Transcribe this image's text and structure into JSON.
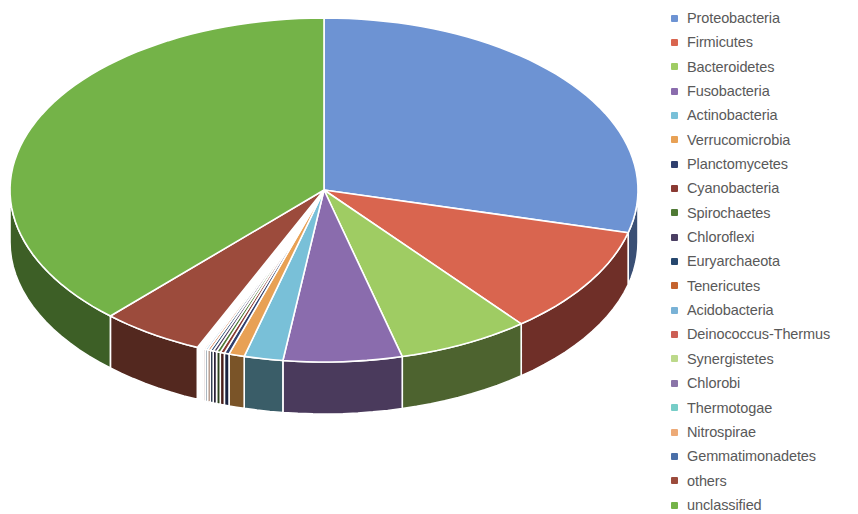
{
  "chart_data": {
    "type": "pie",
    "title": "",
    "subtitle": "",
    "xlabel": "",
    "ylabel": "",
    "legend_position": "right",
    "grid": false,
    "three_d": true,
    "start_angle_deg": 0,
    "direction": "clockwise",
    "labels": [
      "Proteobacteria",
      "Firmicutes",
      "Bacteroidetes",
      "Fusobacteria",
      "Actinobacteria",
      "Verrucomicrobia",
      "Planctomycetes",
      "Cyanobacteria",
      "Spirochaetes",
      "Chloroflexi",
      "Euryarchaeota",
      "Tenericutes",
      "Acidobacteria",
      "Deinococcus-Thermus",
      "Synergistetes",
      "Chlorobi",
      "Thermotogae",
      "Nitrospirae",
      "Gemmatimonadetes",
      "others",
      "unclassified"
    ],
    "values": [
      29.0,
      10.2,
      6.8,
      6.1,
      2.0,
      0.8,
      0.25,
      0.22,
      0.2,
      0.18,
      0.16,
      0.14,
      0.12,
      0.1,
      0.09,
      0.08,
      0.07,
      0.06,
      0.05,
      5.3,
      38.1
    ],
    "colors": [
      "#6d93d3",
      "#d9654f",
      "#9fcc63",
      "#8a6cad",
      "#79c0d8",
      "#e8a155",
      "#2f3f6e",
      "#8a3a33",
      "#4f7a35",
      "#4b3f63",
      "#26476e",
      "#c5632e",
      "#79b2d6",
      "#cc5f55",
      "#bcd98a",
      "#8a74a8",
      "#76cdc7",
      "#edaa77",
      "#4a6fa8",
      "#9c4b3c",
      "#74b348"
    ],
    "side_colors": [
      "#3a4f74",
      "#6f2f28",
      "#4d632f",
      "#4a3a5c",
      "#3a5d68",
      "#7a5428",
      "#1a2340",
      "#4a1f1b",
      "#2b421d",
      "#282135",
      "#15263b",
      "#6b3518",
      "#3c5a6d",
      "#6e332e",
      "#60714a",
      "#4a3e59",
      "#3d6a67",
      "#7d5a40",
      "#283b59",
      "#53281f",
      "#3d5f26"
    ],
    "geometry": {
      "center_x": 324,
      "center_y": 190,
      "radius_x": 314,
      "radius_y": 172,
      "depth": 52
    }
  },
  "legend": {
    "items": [
      {
        "label": "Proteobacteria",
        "color": "#6d93d3"
      },
      {
        "label": "Firmicutes",
        "color": "#d9654f"
      },
      {
        "label": "Bacteroidetes",
        "color": "#9fcc63"
      },
      {
        "label": "Fusobacteria",
        "color": "#8a6cad"
      },
      {
        "label": "Actinobacteria",
        "color": "#79c0d8"
      },
      {
        "label": "Verrucomicrobia",
        "color": "#e8a155"
      },
      {
        "label": "Planctomycetes",
        "color": "#2f3f6e"
      },
      {
        "label": "Cyanobacteria",
        "color": "#8a3a33"
      },
      {
        "label": "Spirochaetes",
        "color": "#4f7a35"
      },
      {
        "label": "Chloroflexi",
        "color": "#4b3f63"
      },
      {
        "label": "Euryarchaeota",
        "color": "#26476e"
      },
      {
        "label": "Tenericutes",
        "color": "#c5632e"
      },
      {
        "label": "Acidobacteria",
        "color": "#79b2d6"
      },
      {
        "label": "Deinococcus-Thermus",
        "color": "#cc5f55"
      },
      {
        "label": "Synergistetes",
        "color": "#bcd98a"
      },
      {
        "label": "Chlorobi",
        "color": "#8a74a8"
      },
      {
        "label": "Thermotogae",
        "color": "#76cdc7"
      },
      {
        "label": "Nitrospirae",
        "color": "#edaa77"
      },
      {
        "label": "Gemmatimonadetes",
        "color": "#4a6fa8"
      },
      {
        "label": "others",
        "color": "#9c4b3c"
      },
      {
        "label": "unclassified",
        "color": "#74b348"
      }
    ]
  }
}
